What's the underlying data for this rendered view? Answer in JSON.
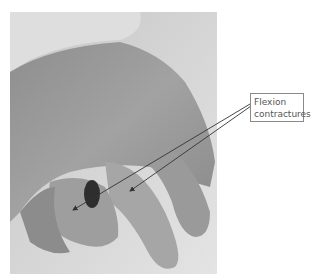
{
  "figure": {
    "annotation": {
      "label_lines": [
        "Flexion",
        "contractures"
      ],
      "arrow_count": 2
    },
    "colors": {
      "background": "#ffffff",
      "photo_tone": "#a9a9a9",
      "label_border": "#8a8a8a",
      "label_text": "#555555",
      "arrow": "#333333"
    }
  }
}
